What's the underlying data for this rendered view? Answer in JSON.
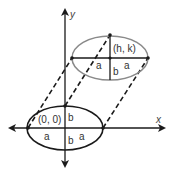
{
  "diagram": {
    "axes": {
      "x_label": "x",
      "y_label": "y"
    },
    "original_ellipse": {
      "center_label": "(0, 0)",
      "semi_major_label": "a",
      "semi_minor_label": "b",
      "stroke_color": "#1a1a1a"
    },
    "translated_ellipse": {
      "center_label": "(h, k)",
      "semi_major_label": "a",
      "semi_minor_label": "b",
      "stroke_color": "#8a8a8a"
    },
    "connectors": {
      "style": "dashed",
      "count": 3
    }
  }
}
